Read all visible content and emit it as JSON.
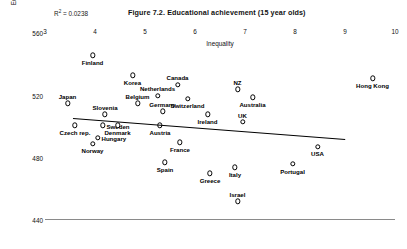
{
  "title": "Figure 7.2. Educational achievement (15 year olds)",
  "r2_label": "R",
  "r2_sup": "2",
  "r2_value": " = 0.0238",
  "axes": {
    "xlabel": "Inequality",
    "ylabel": "Educational achievement (15 year olds)",
    "xticks": [
      "3",
      "4",
      "5",
      "6",
      "7",
      "8",
      "9",
      "10"
    ],
    "yticks": [
      "560",
      "520",
      "480",
      "440"
    ]
  },
  "chart_data": {
    "type": "scatter",
    "title": "Figure 7.2. Educational achievement (15 year olds)",
    "xlabel": "Inequality",
    "ylabel": "Educational achievement (15 year olds)",
    "xlim": [
      3,
      10
    ],
    "ylim": [
      440,
      566
    ],
    "grid": false,
    "legend": false,
    "annotations": [
      "R2 = 0.0238"
    ],
    "r_squared": 0.0238,
    "trendline": {
      "x": [
        3.55,
        9.0
      ],
      "y": [
        505.5,
        492.0
      ],
      "slope": -2.48
    },
    "points": [
      {
        "label": "Finland",
        "x": 3.95,
        "y": 546,
        "label_pos": "below"
      },
      {
        "label": "Korea",
        "x": 4.75,
        "y": 533,
        "label_pos": "below"
      },
      {
        "label": "Canada",
        "x": 5.65,
        "y": 527,
        "label_pos": "above"
      },
      {
        "label": "Hong Kong",
        "x": 9.55,
        "y": 531,
        "label_pos": "below"
      },
      {
        "label": "Netherlands",
        "x": 5.25,
        "y": 520,
        "label_pos": "above"
      },
      {
        "label": "Switzerland",
        "x": 5.85,
        "y": 518,
        "label_pos": "below"
      },
      {
        "label": "NZ",
        "x": 6.85,
        "y": 524,
        "label_pos": "above"
      },
      {
        "label": "Australia",
        "x": 7.15,
        "y": 519,
        "label_pos": "below"
      },
      {
        "label": "Japan",
        "x": 3.45,
        "y": 515,
        "label_pos": "above"
      },
      {
        "label": "Belgium",
        "x": 4.85,
        "y": 515,
        "label_pos": "above"
      },
      {
        "label": "Germany",
        "x": 5.35,
        "y": 510,
        "label_pos": "above"
      },
      {
        "label": "Ireland",
        "x": 6.25,
        "y": 508,
        "label_pos": "below"
      },
      {
        "label": "Slovenia",
        "x": 4.2,
        "y": 508,
        "label_pos": "above"
      },
      {
        "label": "UK",
        "x": 6.95,
        "y": 503,
        "label_pos": "above"
      },
      {
        "label": "Sweden",
        "x": 4.15,
        "y": 501,
        "label_pos": "right"
      },
      {
        "label": "Czech rep.",
        "x": 3.6,
        "y": 501,
        "label_pos": "below"
      },
      {
        "label": "Denmark",
        "x": 4.45,
        "y": 501,
        "label_pos": "below"
      },
      {
        "label": "Austria",
        "x": 5.3,
        "y": 501,
        "label_pos": "below"
      },
      {
        "label": "Hungary",
        "x": 4.05,
        "y": 493,
        "label_pos": "right"
      },
      {
        "label": "Norway",
        "x": 3.95,
        "y": 489,
        "label_pos": "below"
      },
      {
        "label": "France",
        "x": 5.7,
        "y": 490,
        "label_pos": "below"
      },
      {
        "label": "USA",
        "x": 8.45,
        "y": 487,
        "label_pos": "below"
      },
      {
        "label": "Spain",
        "x": 5.4,
        "y": 477,
        "label_pos": "below"
      },
      {
        "label": "Portugal",
        "x": 7.95,
        "y": 476,
        "label_pos": "below"
      },
      {
        "label": "Italy",
        "x": 6.8,
        "y": 474,
        "label_pos": "below"
      },
      {
        "label": "Greece",
        "x": 6.3,
        "y": 470,
        "label_pos": "below"
      },
      {
        "label": "Israel",
        "x": 6.85,
        "y": 452,
        "label_pos": "above"
      }
    ]
  }
}
